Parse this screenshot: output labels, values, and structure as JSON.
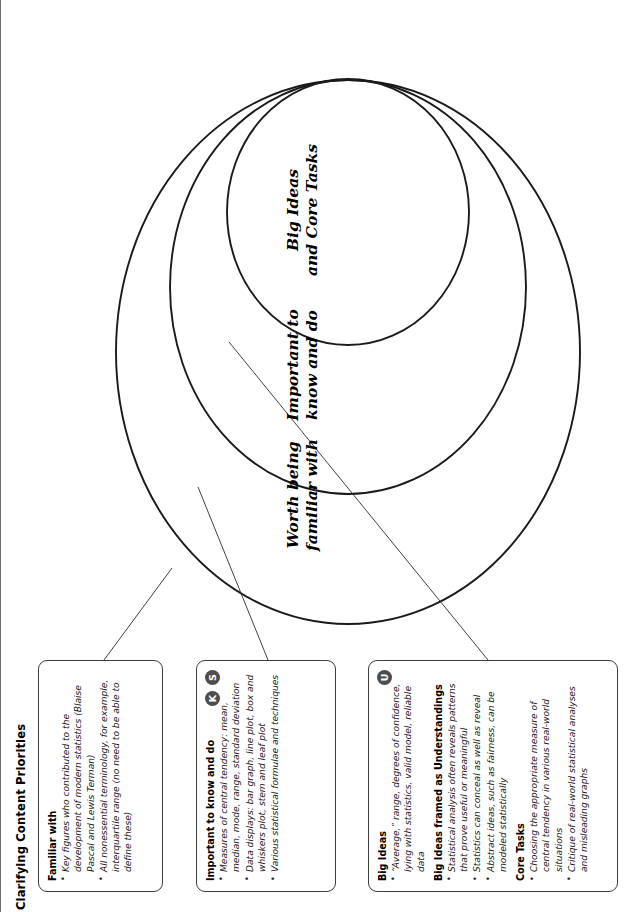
{
  "figure": {
    "title": "Clarifying Content Priorities"
  },
  "callouts": [
    {
      "id": "familiar",
      "badges": [],
      "sections": [
        {
          "heading": "Familiar with",
          "bullets": [
            "Key figures who contributed to the development of modern statistics (Blaise Pascal and Lewis Terman)",
            "All nonessential terminology, for example, interquartile range (no need to be able to define these)"
          ]
        }
      ]
    },
    {
      "id": "important",
      "badges": [
        "K",
        "S"
      ],
      "sections": [
        {
          "heading": "Important to know and do",
          "bullets": [
            "Measures of central tendency: mean, median, mode, range, standard deviation",
            "Data displays: bar graph, line plot, box and whiskers plot, stem and leaf plot",
            "Various statistical formulae and techniques"
          ]
        }
      ]
    },
    {
      "id": "bigideas",
      "badges": [
        "U"
      ],
      "sections": [
        {
          "heading": "Big Ideas",
          "bullets": [
            "“Average,” range, degrees of confidence, lying with statistics, valid model, reliable data"
          ]
        },
        {
          "heading": "Big Ideas framed as Understandings",
          "bullets": [
            "Statistical analysis often reveals patterns that prove useful or meaningful",
            "Statistics can conceal as well as reveal",
            "Abstract ideas, such as fairness, can be modeled statistically"
          ]
        },
        {
          "heading": "Core Tasks",
          "bullets": [
            "Choosing the appropriate measure of central tendency in various real-world situations",
            "Critique of real-world statistical analyses and misleading graphs"
          ]
        }
      ]
    }
  ],
  "rings": {
    "outer": "Worth being\nfamiliar with",
    "middle": "Important to\nknow and do",
    "inner": "Big Ideas\nand Core Tasks"
  },
  "colors": {
    "stroke": "#1a1a1a",
    "badge_fill": "#4d4d4d",
    "badge_text": "#ffffff",
    "rule": "#6f6f6f",
    "background": "#ffffff"
  }
}
